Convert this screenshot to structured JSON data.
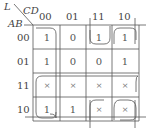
{
  "kmap": {
    "corner_label": "L",
    "col_var": "CD",
    "row_var": "AB",
    "col_headers": [
      "00",
      "01",
      "11",
      "10"
    ],
    "row_headers": [
      "00",
      "01",
      "11",
      "10"
    ],
    "cells": [
      [
        "1",
        "0",
        "1",
        "1"
      ],
      [
        "1",
        "0",
        "0",
        "1"
      ],
      [
        "×",
        "×",
        "×",
        "×"
      ],
      [
        "1",
        "1",
        "×",
        "×"
      ]
    ]
  },
  "groupings": [
    {
      "name": "col-00-rows-00-01 wrap",
      "desc": "column CD=00, rows 00-01 (open bottom)"
    },
    {
      "name": "row-11-10 col-00",
      "desc": "rows 11 and 10, columns 00 (open top)"
    },
    {
      "name": "row-11 all",
      "desc": "entire row AB=11"
    },
    {
      "name": "col-10",
      "desc": "column CD=10 full"
    },
    {
      "name": "corners",
      "desc": "AB=00/10 × CD=11/10"
    }
  ]
}
